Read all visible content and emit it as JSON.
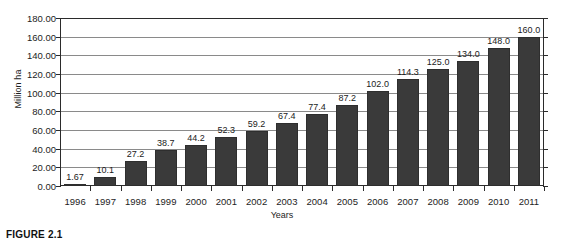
{
  "caption": "FIGURE 2.1",
  "chart_data": {
    "type": "bar",
    "title": "",
    "xlabel": "Years",
    "ylabel": "Million ha",
    "categories": [
      "1996",
      "1997",
      "1998",
      "1999",
      "2000",
      "2001",
      "2002",
      "2003",
      "2004",
      "2005",
      "2006",
      "2007",
      "2008",
      "2009",
      "2010",
      "2011"
    ],
    "values": [
      1.67,
      10.1,
      27.2,
      38.7,
      44.2,
      52.3,
      59.2,
      67.4,
      77.4,
      87.2,
      102.0,
      114.3,
      125.0,
      134.0,
      148.0,
      160.0
    ],
    "data_labels": [
      "1.67",
      "10.1",
      "27.2",
      "38.7",
      "44.2",
      "52.3",
      "59.2",
      "67.4",
      "77.4",
      "87.2",
      "102.0",
      "114.3",
      "125.0",
      "134.0",
      "148.0",
      "160.0"
    ],
    "ylim": [
      0,
      180
    ],
    "ytick_values": [
      0,
      20,
      40,
      60,
      80,
      100,
      120,
      140,
      160,
      180
    ],
    "ytick_labels": [
      "0.00",
      "20.00",
      "40.00",
      "60.00",
      "80.00",
      "100.00",
      "120.00",
      "140.00",
      "160.00",
      "180.00"
    ],
    "grid": true,
    "legend": "none",
    "bar_color": "#3a3a3a",
    "gridline_color": "#8a8a8a",
    "axis_color": "#2b2b2b"
  }
}
